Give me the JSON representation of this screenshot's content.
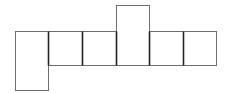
{
  "diagram": {
    "type": "net",
    "colors": {
      "background": "#ffffff",
      "outline": "#6e6e6e",
      "inner_edge": "#222222"
    },
    "faces": [
      {
        "id": "left-tall",
        "x": 15,
        "y": 31,
        "w": 33,
        "h": 59
      },
      {
        "id": "square-1",
        "x": 48,
        "y": 31,
        "w": 34,
        "h": 34
      },
      {
        "id": "square-2",
        "x": 82,
        "y": 31,
        "w": 34,
        "h": 34
      },
      {
        "id": "top-tall",
        "x": 116,
        "y": 5,
        "w": 33,
        "h": 60
      },
      {
        "id": "square-3",
        "x": 149,
        "y": 31,
        "w": 34,
        "h": 34
      },
      {
        "id": "square-4",
        "x": 183,
        "y": 31,
        "w": 33,
        "h": 34
      }
    ]
  }
}
